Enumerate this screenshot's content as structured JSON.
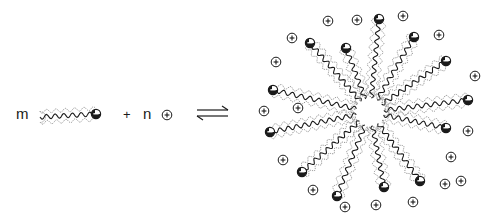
{
  "diagram": {
    "reactants": {
      "surfactant_coefficient": "m",
      "plus_sign": "+",
      "counterion_coefficient": "n",
      "counterion_symbol": "+",
      "head_symbol": "−"
    },
    "equilibrium_arrow": "⇌",
    "product": {
      "type": "spherical micelle",
      "surfactant_count": 13,
      "counterion_count": 18,
      "head_charge": "−",
      "counterion_charge": "+"
    },
    "colors": {
      "ink": "#1a1a1a",
      "halo": "#8a8a8a",
      "background": "#ffffff"
    }
  }
}
